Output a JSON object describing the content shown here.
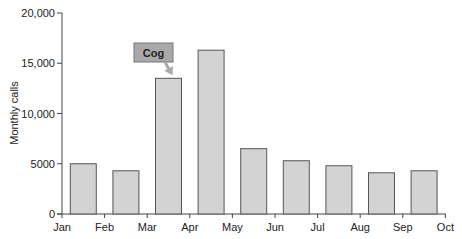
{
  "chart_data": {
    "type": "bar",
    "title": "",
    "xlabel": "",
    "ylabel": "Monthly calls",
    "ylim": [
      0,
      20000
    ],
    "yticks": [
      0,
      5000,
      10000,
      15000,
      20000
    ],
    "ytick_labels": [
      "0",
      "5000",
      "10,000",
      "15,000",
      "20,000"
    ],
    "xtick_labels": [
      "Jan",
      "Feb",
      "Mar",
      "Apr",
      "May",
      "Jun",
      "Jul",
      "Aug",
      "Sep",
      "Oct"
    ],
    "categories": [
      "Jan",
      "Feb",
      "Mar",
      "Apr",
      "May",
      "Jun",
      "Jul",
      "Aug",
      "Sep"
    ],
    "values": [
      5000,
      4300,
      13500,
      16300,
      6500,
      5300,
      4800,
      4100,
      4300
    ],
    "grid": false,
    "annotations": [
      {
        "text": "Cog",
        "target_category": "Mar"
      }
    ],
    "colors": {
      "bar_fill": "#d3d3d3",
      "bar_stroke": "#555555",
      "annotation_fill": "#a9a9a9",
      "annotation_stroke": "#777777",
      "axis": "#444444"
    }
  }
}
